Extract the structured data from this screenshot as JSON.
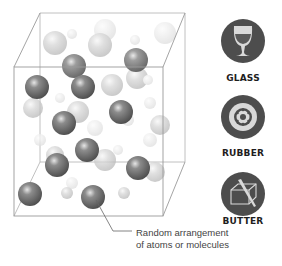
{
  "diagram": {
    "caption": {
      "line1": "Random arrangement",
      "line2": "of atoms or molecules"
    },
    "examples": [
      {
        "label": "GLASS",
        "icon": "wine-glass-icon"
      },
      {
        "label": "RUBBER",
        "icon": "tire-icon"
      },
      {
        "label": "BUTTER",
        "icon": "butter-block-icon"
      }
    ],
    "colors": {
      "icon_circle": "#4d4d4d",
      "icon_glyph": "#d9d9d9",
      "cube_edge": "#9a9a9a",
      "front_sphere": "#6e6e6e",
      "back_sphere": "#cfcfcf",
      "leader_line": "#666666"
    }
  }
}
